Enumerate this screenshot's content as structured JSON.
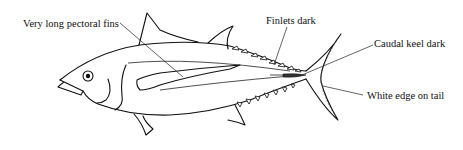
{
  "diagram": {
    "labels": [
      {
        "id": "pectoral",
        "text": "Very long pectoral fins"
      },
      {
        "id": "finlets",
        "text": "Finlets dark"
      },
      {
        "id": "keel",
        "text": "Caudal keel dark"
      },
      {
        "id": "tail",
        "text": "White edge on tail"
      }
    ]
  }
}
